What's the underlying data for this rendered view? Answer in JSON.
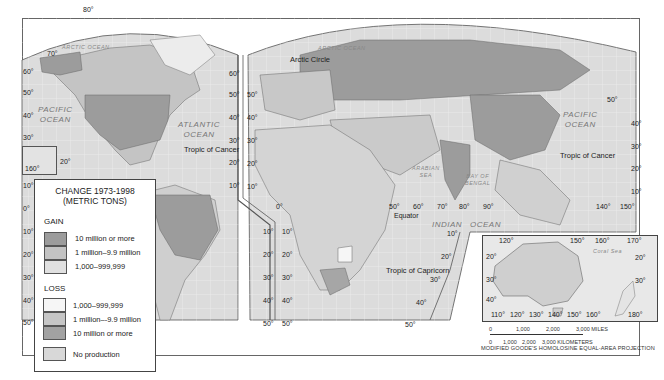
{
  "header": {
    "partial_caption": "…primarily China and Brazil."
  },
  "map": {
    "projection": "MODIFIED GOODE'S HOMOLOSINE EQUAL-AREA PROJECTION",
    "oceans": {
      "arctic_left": "ARCTIC OCEAN",
      "arctic_right": "ARCTIC OCEAN",
      "pacific_left": "PACIFIC\nOCEAN",
      "atlantic": "ATLANTIC\nOCEAN",
      "pacific_right": "PACIFIC\nOCEAN",
      "indian_1": "INDIAN",
      "indian_2": "OCEAN",
      "arabian_sea": "ARABIAN\nSEA",
      "bay_of_bengal": "BAY OF\nBENGAL",
      "coral_sea": "Coral Sea"
    },
    "lines": {
      "arctic_circle": "Arctic Circle",
      "tropic_cancer_left": "Tropic of Cancer",
      "tropic_cancer_right": "Tropic of Cancer",
      "equator": "Equator",
      "tropic_capricorn": "Tropic of Capricorn"
    },
    "lat_left": [
      "80°",
      "70°",
      "60°",
      "50°",
      "40°",
      "30°",
      "20°",
      "10°",
      "0°",
      "10°",
      "20°",
      "30°",
      "40°",
      "50°"
    ],
    "lat_mid_na": [
      "60°",
      "50°",
      "40°",
      "30°",
      "20°",
      "10°"
    ],
    "lat_mid_eu": [
      "50°",
      "40°",
      "30°",
      "20°",
      "10°"
    ],
    "lat_sa_right": [
      "10°",
      "20°",
      "30°",
      "40°",
      "50°"
    ],
    "lat_af_left": [
      "0°",
      "10°",
      "20°",
      "30°",
      "40°",
      "50°"
    ],
    "lat_indian": [
      "10°",
      "20°",
      "30°",
      "40°",
      "50°"
    ],
    "lat_pacific_right": [
      "50°",
      "40°",
      "30°",
      "20°",
      "10°"
    ],
    "lon_equator": [
      "50°",
      "60°",
      "70°",
      "80°",
      "90°",
      "140°",
      "150°"
    ],
    "hawaii_lon": "160°",
    "hawaii_lat": "20°",
    "inset_australia": {
      "top_lon": [
        "120°",
        "150°",
        "160°",
        "170°"
      ],
      "lat_left": [
        "20°",
        "30°",
        "40°"
      ],
      "lat_right": [
        "20°",
        "30°"
      ],
      "bottom_lon": [
        "110°",
        "120°",
        "130°",
        "140°",
        "150°",
        "160°",
        "180°"
      ]
    },
    "scale": {
      "miles": [
        "0",
        "1,000",
        "2,000",
        "3,000 MILES"
      ],
      "km": [
        "0",
        "1,000",
        "2,000",
        "3,000 KILOMETERS"
      ]
    }
  },
  "legend": {
    "title_1": "CHANGE 1973-1998",
    "title_2": "(METRIC TONS)",
    "gain_label": "GAIN",
    "gain": [
      {
        "label": "10 million or more",
        "color": "#9c9c9c"
      },
      {
        "label": "1 million–9.9 million",
        "color": "#c3c3c3"
      },
      {
        "label": "1,000–999,999",
        "color": "#e0e0e0"
      }
    ],
    "loss_label": "LOSS",
    "loss": [
      {
        "label": "1,000–999,999",
        "color": "#f6f6f6"
      },
      {
        "label": "1 million–-9.9 million",
        "color": "#c6c6c6"
      },
      {
        "label": "10 million or more",
        "color": "#a2a2a2"
      }
    ],
    "none": {
      "label": "No production",
      "color": "#d8d8d8"
    }
  }
}
